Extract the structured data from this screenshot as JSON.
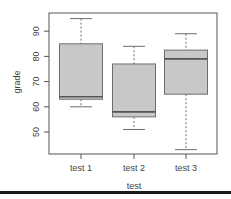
{
  "chart_data": {
    "type": "boxplot",
    "title": "",
    "xlabel": "test",
    "ylabel": "grade",
    "categories": [
      "test 1",
      "test 2",
      "test 3"
    ],
    "yticks": [
      50,
      60,
      70,
      80,
      90
    ],
    "ylim": [
      41,
      97
    ],
    "grid": false,
    "legend": null,
    "boxes": [
      {
        "name": "test 1",
        "whisker_low": 60,
        "q1": 63,
        "median": 64,
        "q3": 85,
        "whisker_high": 95
      },
      {
        "name": "test 2",
        "whisker_low": 51,
        "q1": 56,
        "median": 58,
        "q3": 77,
        "whisker_high": 84
      },
      {
        "name": "test 3",
        "whisker_low": 43,
        "q1": 65,
        "median": 79,
        "q3": 82.5,
        "whisker_high": 89
      }
    ],
    "colors": {
      "box_fill": "#c8c8c8",
      "box_border": "#6e6e6e",
      "axis": "#555555",
      "text": "#444444"
    }
  }
}
